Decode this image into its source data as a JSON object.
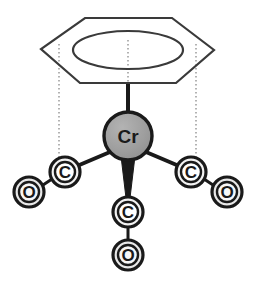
{
  "figure": {
    "name": "benzene-chromium-tricarbonyl-structure",
    "kind": "chemical-structure-diagram",
    "background_color": "#ffffff"
  },
  "palette": {
    "outline": "#1a1a1a",
    "bond": "#1a1a1a",
    "metal_fill": "#9e9e9e",
    "carbon_fill": "#f2f2f2",
    "carbon_inner_fill": "#ffffff",
    "oxygen_fill": "#e8e8e8",
    "ring_stroke": "#3a3a3a",
    "guide_stroke": "#8a8a8a"
  },
  "ring": {
    "name": "benzene-ring",
    "shape": "flattened-hexagon-perspective",
    "vertices": [
      {
        "x": 85,
        "y": 18
      },
      {
        "x": 172,
        "y": 18
      },
      {
        "x": 214,
        "y": 50
      },
      {
        "x": 176,
        "y": 83
      },
      {
        "x": 80,
        "y": 83
      },
      {
        "x": 41,
        "y": 49
      }
    ],
    "aromatic_ellipse": {
      "cx": 128,
      "cy": 50,
      "rx": 55,
      "ry": 19
    },
    "stroke_width": 2
  },
  "atoms": [
    {
      "id": "cr",
      "label": "Cr",
      "element": "chromium",
      "cx": 128,
      "cy": 136,
      "r": 24,
      "style": "filled-gray",
      "font_class": "atom-label-metal"
    },
    {
      "id": "c-left",
      "label": "C",
      "element": "carbon",
      "cx": 65,
      "cy": 172,
      "r": 15,
      "inner_r": 10,
      "style": "ring-donut",
      "font_class": "atom-label-small"
    },
    {
      "id": "o-left",
      "label": "O",
      "element": "oxygen",
      "cx": 29,
      "cy": 192,
      "r": 15,
      "inner_r": 10,
      "style": "ring-donut",
      "font_class": "atom-label-small"
    },
    {
      "id": "c-right",
      "label": "C",
      "element": "carbon",
      "cx": 191,
      "cy": 172,
      "r": 15,
      "inner_r": 10,
      "style": "ring-donut",
      "font_class": "atom-label-small"
    },
    {
      "id": "o-right",
      "label": "O",
      "element": "oxygen",
      "cx": 227,
      "cy": 192,
      "r": 15,
      "inner_r": 10,
      "style": "ring-donut",
      "font_class": "atom-label-small"
    },
    {
      "id": "c-front",
      "label": "C",
      "element": "carbon",
      "cx": 128,
      "cy": 212,
      "r": 15,
      "inner_r": 10,
      "style": "ring-donut",
      "font_class": "atom-label-small"
    },
    {
      "id": "o-front",
      "label": "O",
      "element": "oxygen",
      "cx": 128,
      "cy": 255,
      "r": 15,
      "inner_r": 10,
      "style": "ring-donut",
      "font_class": "atom-label-small"
    }
  ],
  "bonds": [
    {
      "id": "bond-ring-cr",
      "from": "benzene-ring-centroid",
      "to": "cr",
      "type": "solid",
      "x1": 128,
      "y1": 84,
      "x2": 128,
      "y2": 114,
      "width": 4
    },
    {
      "id": "bond-cr-c-left",
      "from": "cr",
      "to": "c-left",
      "type": "solid",
      "x1": 110,
      "y1": 152,
      "x2": 77,
      "y2": 166,
      "width": 4
    },
    {
      "id": "bond-cr-c-right",
      "from": "cr",
      "to": "c-right",
      "type": "solid",
      "x1": 146,
      "y1": 152,
      "x2": 179,
      "y2": 166,
      "width": 4
    },
    {
      "id": "bond-c-left-o-left",
      "from": "c-left",
      "to": "o-left",
      "type": "solid",
      "x1": 52,
      "y1": 179,
      "x2": 43,
      "y2": 185,
      "width": 3
    },
    {
      "id": "bond-c-right-o-right",
      "from": "c-right",
      "to": "o-right",
      "type": "solid",
      "x1": 204,
      "y1": 179,
      "x2": 213,
      "y2": 185,
      "width": 3
    },
    {
      "id": "bond-c-front-o-front",
      "from": "c-front",
      "to": "o-front",
      "type": "solid",
      "x1": 128,
      "y1": 227,
      "x2": 128,
      "y2": 240,
      "width": 3
    }
  ],
  "wedge_bond": {
    "id": "bond-cr-c-front-wedge",
    "from": "cr",
    "to": "c-front",
    "type": "solid-wedge",
    "points": "121,156 135,156 130,198 126,198"
  },
  "guide_lines": [
    {
      "id": "guide-left",
      "type": "dotted",
      "x1": 59,
      "y1": 44,
      "x2": 59,
      "y2": 157
    },
    {
      "id": "guide-center",
      "type": "dotted",
      "x1": 128,
      "y1": 40,
      "x2": 128,
      "y2": 84
    },
    {
      "id": "guide-right",
      "type": "dotted",
      "x1": 196,
      "y1": 44,
      "x2": 196,
      "y2": 157
    }
  ]
}
